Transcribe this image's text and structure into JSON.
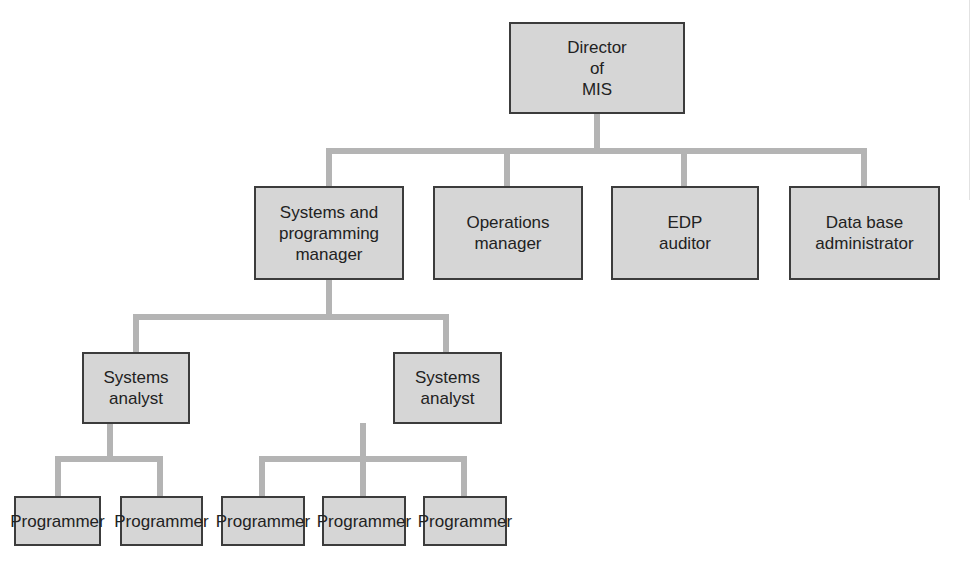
{
  "diagram": {
    "type": "org-chart",
    "colors": {
      "box_fill": "#d6d6d6",
      "box_border": "#3c3c3c",
      "connector": "#b4b4b4",
      "text": "#222222"
    },
    "nodes": {
      "director": {
        "label": "Director\nof\nMIS"
      },
      "spm": {
        "label": "Systems and\nprogramming\nmanager",
        "reports_to": "director"
      },
      "ops": {
        "label": "Operations\nmanager",
        "reports_to": "director"
      },
      "edp": {
        "label": "EDP\nauditor",
        "reports_to": "director"
      },
      "dba": {
        "label": "Data base\nadministrator",
        "reports_to": "director"
      },
      "analyst1": {
        "label": "Systems\nanalyst",
        "reports_to": "spm"
      },
      "analyst2": {
        "label": "Systems\nanalyst",
        "reports_to": "spm"
      },
      "prog1": {
        "label": "Programmer",
        "reports_to": "analyst1"
      },
      "prog2": {
        "label": "Programmer",
        "reports_to": "analyst1"
      },
      "prog3": {
        "label": "Programmer",
        "reports_to": "analyst2"
      },
      "prog4": {
        "label": "Programmer",
        "reports_to": "analyst2"
      },
      "prog5": {
        "label": "Programmer",
        "reports_to": "analyst2"
      }
    }
  }
}
